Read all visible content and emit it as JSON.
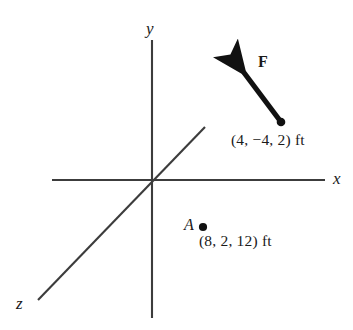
{
  "figure": {
    "background_color": "#ffffff",
    "line_color": "#3c3c3c",
    "vector_color": "#111111",
    "width": 353,
    "height": 330
  },
  "axes": {
    "origin": {
      "x": 152,
      "y": 180
    },
    "y_axis": {
      "label": "y",
      "x1": 152,
      "y1": 40,
      "x2": 152,
      "y2": 318
    },
    "x_axis": {
      "label": "x",
      "x1": 52,
      "y1": 180,
      "x2": 325,
      "y2": 180
    },
    "z_axis": {
      "label": "z",
      "x1": 205,
      "y1": 127,
      "x2": 38,
      "y2": 300
    }
  },
  "force_vector": {
    "label": "F",
    "tail": {
      "x": 281,
      "y": 122
    },
    "tip": {
      "x": 238,
      "y": 65
    },
    "application_point_label": "(4, −4, 2) ft",
    "application_point": {
      "x": 4,
      "y": -4,
      "z": 2,
      "units": "ft"
    }
  },
  "point_a": {
    "label": "A",
    "dot": {
      "x": 203,
      "y": 227
    },
    "coords_label": "(8, 2, 12) ft",
    "coords": {
      "x": 8,
      "y": 2,
      "z": 12,
      "units": "ft"
    }
  }
}
